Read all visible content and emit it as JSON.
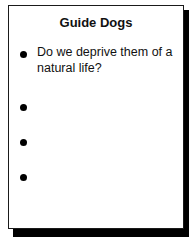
{
  "slide": {
    "title": "Guide Dogs",
    "bullets": [
      {
        "text": "Do we deprive them of a natural life?"
      },
      {
        "text": ""
      },
      {
        "text": ""
      },
      {
        "text": ""
      }
    ]
  },
  "colors": {
    "background": "#ffffff",
    "text": "#111111",
    "border": "#1a1a1a",
    "shadow": "#000000"
  }
}
